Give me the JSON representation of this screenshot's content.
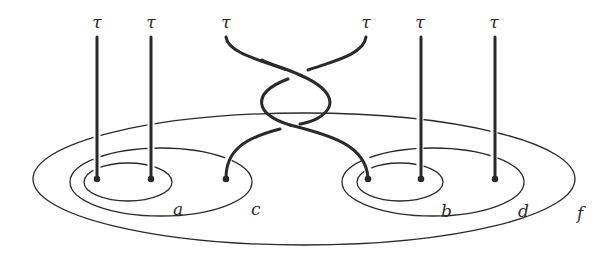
{
  "diagram": {
    "type": "braid-on-curves",
    "colors": {
      "ink": "#2a2a2a",
      "background": "#ffffff"
    },
    "strand_top_labels": [
      "τ",
      "τ",
      "τ",
      "τ",
      "τ",
      "τ"
    ],
    "points": [
      {
        "id": "p1",
        "x": 97,
        "y": 179
      },
      {
        "id": "p2",
        "x": 151,
        "y": 179
      },
      {
        "id": "p3",
        "x": 226,
        "y": 179
      },
      {
        "id": "p4",
        "x": 368,
        "y": 179
      },
      {
        "id": "p5",
        "x": 421,
        "y": 179
      },
      {
        "id": "p6",
        "x": 495,
        "y": 179
      }
    ],
    "curves": [
      {
        "label": "a",
        "encloses": [
          "p1",
          "p2"
        ]
      },
      {
        "label": "c",
        "encloses": [
          "p1",
          "p2",
          "p3"
        ]
      },
      {
        "label": "b",
        "encloses": [
          "p4",
          "p5"
        ]
      },
      {
        "label": "d",
        "encloses": [
          "p4",
          "p5",
          "p6"
        ]
      },
      {
        "label": "f",
        "encloses": [
          "p1",
          "p2",
          "p3",
          "p4",
          "p5",
          "p6"
        ]
      }
    ],
    "crossing": {
      "strands": [
        "p3",
        "p4"
      ],
      "twists": 2
    }
  }
}
